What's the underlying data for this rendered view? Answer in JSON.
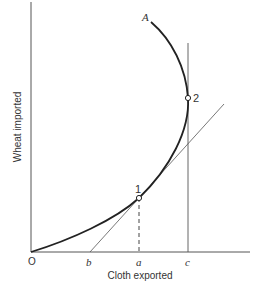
{
  "diagram": {
    "x_axis_label": "Cloth exported",
    "y_axis_label": "Wheat imported",
    "origin_label": "O",
    "curve_label": "A",
    "x_ticks": [
      "b",
      "a",
      "c"
    ],
    "points": [
      {
        "label": "1",
        "description": "Tangency point of line from b with curve, above a"
      },
      {
        "label": "2",
        "description": "Point where vertical line at c touches the curve"
      }
    ],
    "colors": {
      "curve": "#222222",
      "lines": "#555555",
      "background": "#ffffff"
    }
  }
}
